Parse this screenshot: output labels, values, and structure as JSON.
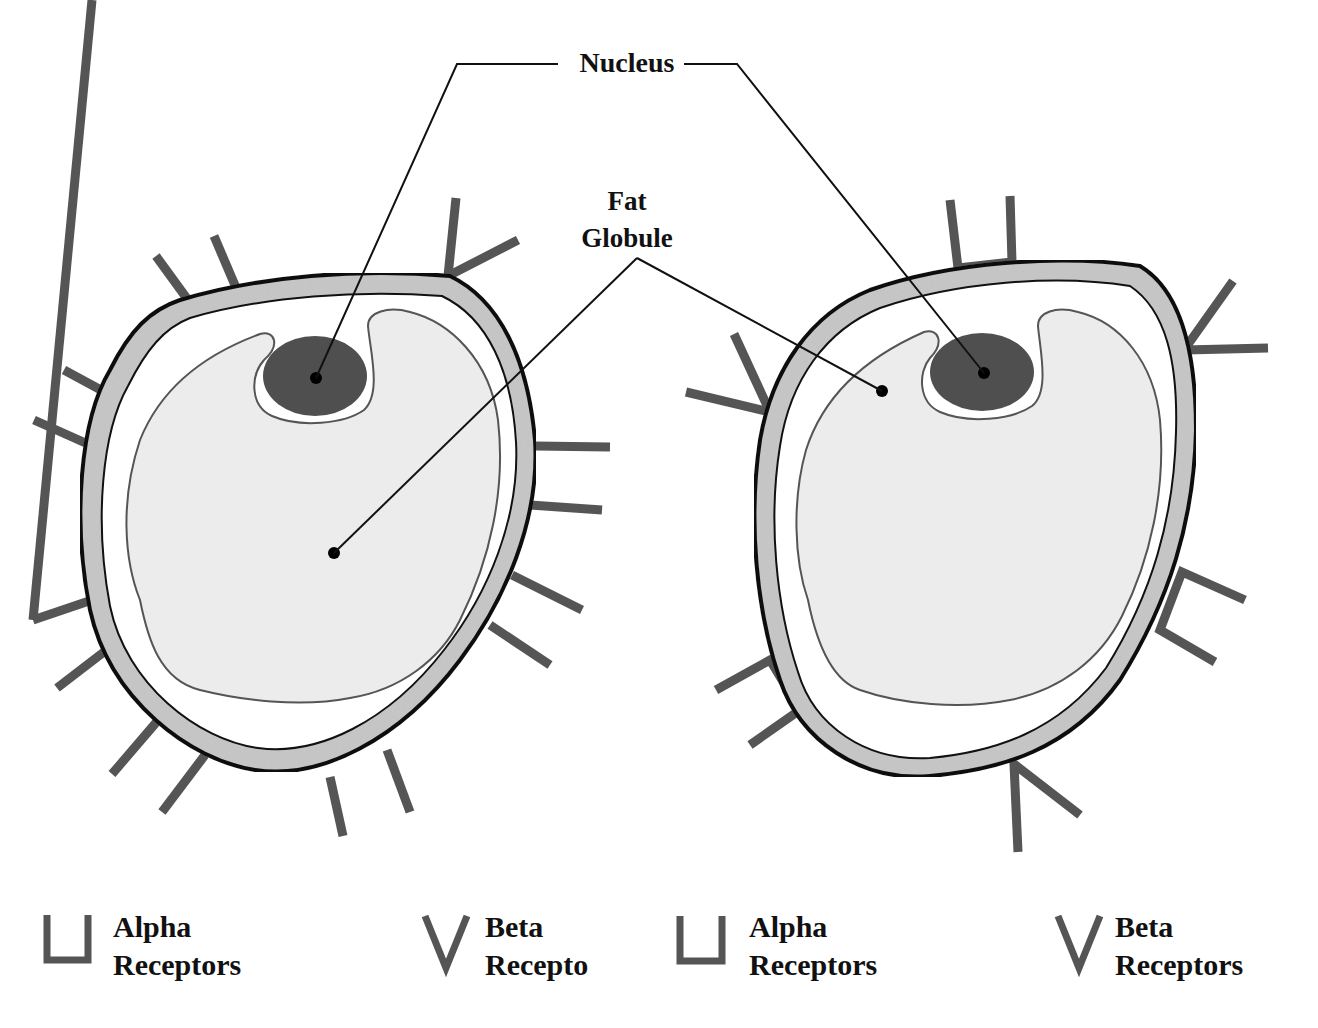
{
  "labels": {
    "nucleus": "Nucleus",
    "fat_line1": "Fat",
    "fat_line2": "Globule"
  },
  "legend": [
    {
      "symbol": "alpha-receptor",
      "line1": "Alpha",
      "line2": "Receptors"
    },
    {
      "symbol": "beta-receptor",
      "line1": "Beta",
      "line2": "Recepto"
    },
    {
      "symbol": "alpha-receptor",
      "line1": "Alpha",
      "line2": "Receptors"
    },
    {
      "symbol": "beta-receptor",
      "line1": "Beta",
      "line2": "Receptors"
    }
  ],
  "colors": {
    "receptor": "#555555",
    "membrane_band": "#c8c8c8",
    "cell_outline": "#111111",
    "cytoplasm": "#ffffff",
    "fat_globule": "#ececec",
    "nucleus": "#4f4f4f",
    "leader_line": "#111111"
  },
  "cells": [
    {
      "name": "left-cell",
      "description": "Fat cell with beta-style single-stalk receptors"
    },
    {
      "name": "right-cell",
      "description": "Fat cell with alpha (U) and beta (V) receptors"
    }
  ]
}
